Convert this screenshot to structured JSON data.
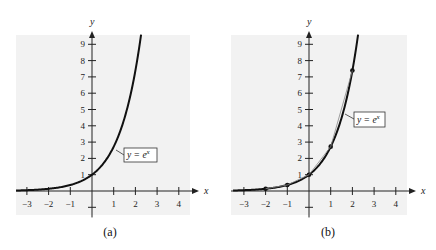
{
  "chart_data": [
    {
      "type": "line",
      "panel": "a",
      "caption": "(a)",
      "title": "",
      "xlabel": "x",
      "ylabel": "y",
      "function": "y = e^x",
      "annotation": "y = e^x",
      "x_ticks": [
        -3,
        -2,
        -1,
        1,
        2,
        3,
        4
      ],
      "y_ticks": [
        1,
        2,
        3,
        4,
        5,
        6,
        7,
        8,
        9
      ],
      "xlim": [
        -3.5,
        4.5
      ],
      "ylim": [
        -1.5,
        9.8
      ],
      "x": [
        -3.5,
        -3,
        -2,
        -1,
        0,
        1,
        1.5,
        2,
        2.25
      ],
      "y": [
        0.03,
        0.05,
        0.14,
        0.37,
        1,
        2.72,
        4.48,
        7.39,
        9.49
      ],
      "points": [],
      "grid": false,
      "background": "#f2f2f2"
    },
    {
      "type": "line",
      "panel": "b",
      "caption": "(b)",
      "title": "",
      "xlabel": "x",
      "ylabel": "y",
      "function": "y = e^x",
      "annotation": "y = e^x",
      "x_ticks": [
        -3,
        -2,
        -1,
        1,
        2,
        3,
        4
      ],
      "y_ticks": [
        1,
        2,
        3,
        4,
        5,
        6,
        7,
        8,
        9
      ],
      "xlim": [
        -3.5,
        4.5
      ],
      "ylim": [
        -1.5,
        9.8
      ],
      "x": [
        -3.5,
        -3,
        -2,
        -1,
        0,
        1,
        1.5,
        2,
        2.25
      ],
      "y": [
        0.03,
        0.05,
        0.14,
        0.37,
        1,
        2.72,
        4.48,
        7.39,
        9.49
      ],
      "points": [
        {
          "x": -2,
          "y": 0.14
        },
        {
          "x": -1,
          "y": 0.37
        },
        {
          "x": 0,
          "y": 1
        },
        {
          "x": 1,
          "y": 2.72
        },
        {
          "x": 2,
          "y": 7.39
        }
      ],
      "grid": false,
      "background": "#f2f2f2"
    }
  ],
  "labels": {
    "a": {
      "caption": "(a)",
      "x_axis": "x",
      "y_axis": "y",
      "equation_prefix": "y = e",
      "equation_exp": "x"
    },
    "b": {
      "caption": "(b)",
      "x_axis": "x",
      "y_axis": "y",
      "equation_prefix": "y = e",
      "equation_exp": "x"
    }
  },
  "colors": {
    "background_panel": "#f2f2f2",
    "curve": "#111111",
    "axis": "#222222"
  }
}
